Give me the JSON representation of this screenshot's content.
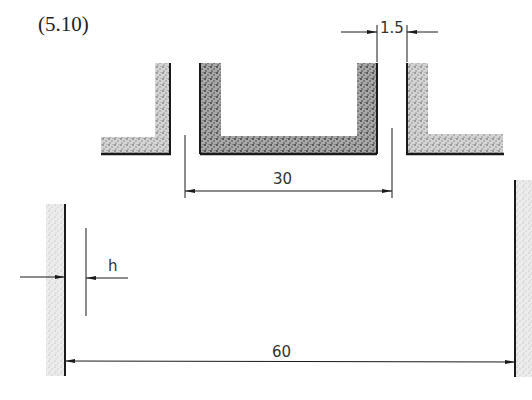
{
  "figure": {
    "equation_label": "(5.10)"
  },
  "dimensions": {
    "gap_label": "1.5",
    "channel_width_label": "30",
    "plate_separation_label": "60",
    "thickness_label": "h"
  },
  "colors": {
    "line": "#1a1a1a",
    "hatch_fill": "#b8b8b8",
    "background": "#ffffff"
  }
}
